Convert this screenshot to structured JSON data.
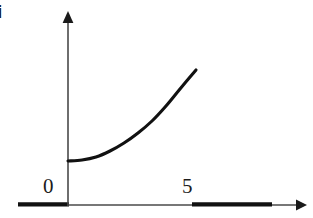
{
  "figure": {
    "panel_letter": "i",
    "background_color": "#ffffff",
    "ink_color": "#1a1a1a",
    "axis_color": "#4a4a4a",
    "curve_color": "#111111",
    "width": 313,
    "height": 218
  },
  "axes": {
    "x_axis": {
      "name": "x-axis",
      "y_pixel": 205,
      "start_x": 18,
      "end_x": 305,
      "has_arrow": true,
      "arrow_direction": "right"
    },
    "y_axis": {
      "name": "y-axis",
      "x_pixel": 68,
      "start_y": 205,
      "end_y": 12,
      "has_arrow": true,
      "arrow_direction": "up"
    },
    "origin": {
      "x": 68,
      "y": 205
    }
  },
  "tick_labels": [
    {
      "text": "0",
      "axis": "x",
      "x": 43,
      "y": 176
    },
    {
      "text": "5",
      "axis": "x",
      "x": 182,
      "y": 176
    }
  ],
  "highlighted_segments": [
    {
      "name": "left-bold-segment",
      "x_start": 18,
      "x_end": 68,
      "y": 205
    },
    {
      "name": "right-bold-segment",
      "x_start": 192,
      "x_end": 272,
      "y": 205
    }
  ],
  "chart_data": {
    "type": "line",
    "title": "",
    "subtitle": "",
    "xlabel": "",
    "ylabel": "",
    "grid": false,
    "legend": null,
    "xlim": [
      0,
      5
    ],
    "ylim": [
      0,
      5
    ],
    "x_tick_labels": [
      "0",
      "5"
    ],
    "y_tick_labels": [],
    "series": [
      {
        "name": "exponential-curve",
        "color": "#111111",
        "x": [
          0.0,
          0.5,
          1.0,
          1.5,
          2.0,
          2.5,
          3.0,
          3.5,
          4.0,
          4.5
        ],
        "y": [
          0.8,
          0.83,
          0.92,
          1.07,
          1.3,
          1.62,
          2.05,
          2.62,
          3.35,
          4.3
        ],
        "pixel_points": [
          {
            "x": 68,
            "y": 161
          },
          {
            "x": 82,
            "y": 160
          },
          {
            "x": 96,
            "y": 157
          },
          {
            "x": 110,
            "y": 151
          },
          {
            "x": 124,
            "y": 143
          },
          {
            "x": 138,
            "y": 133
          },
          {
            "x": 152,
            "y": 121
          },
          {
            "x": 166,
            "y": 106
          },
          {
            "x": 180,
            "y": 89
          },
          {
            "x": 196,
            "y": 70
          }
        ],
        "shape": "monotonic increasing, convex (exponential-like growth)"
      }
    ],
    "annotations": [
      {
        "text": "i",
        "role": "panel-letter",
        "x": 0,
        "y": 4
      }
    ]
  }
}
